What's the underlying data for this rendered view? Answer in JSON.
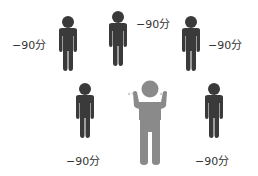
{
  "people": [
    {
      "id": "p1",
      "label": "−90分"
    },
    {
      "id": "p2",
      "label": "−90分"
    },
    {
      "id": "p3",
      "label": "−90分"
    },
    {
      "id": "p4",
      "label": "−90分"
    },
    {
      "id": "p5",
      "label": "−90分"
    }
  ],
  "center": {
    "label": "",
    "marks": "ᵍ ᵑ"
  },
  "colors": {
    "person": "#3a3a3a",
    "center": "#8a8a8a",
    "text": "#333333"
  }
}
